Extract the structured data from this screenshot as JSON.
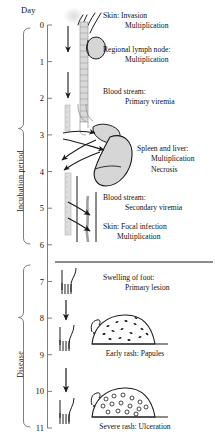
{
  "figure": {
    "axis_title": "Day",
    "tick_labels": [
      "0",
      "1",
      "2",
      "3",
      "4",
      "5",
      "6",
      "7",
      "8",
      "9",
      "10",
      "11"
    ],
    "phase_brackets": [
      {
        "label": "Incubation period",
        "from_day": 0,
        "to_day": 7
      },
      {
        "label": "Disease",
        "from_day": 7,
        "to_day": 11
      }
    ],
    "events": [
      {
        "id": "skin-invasion",
        "day": 0.1,
        "line1": "Skin: Invasion",
        "line2": "Multiplication"
      },
      {
        "id": "regional-lymph-node",
        "day": 1.0,
        "line1": "Regional lymph node:",
        "line2": "Multiplication"
      },
      {
        "id": "blood-primary",
        "day": 2.3,
        "line1": "Blood stream:",
        "line2": "Primary viremia"
      },
      {
        "id": "spleen-liver",
        "day": 3.8,
        "line1": "Spleen and liver:",
        "line2": "Multiplication",
        "line3": "Necrosis"
      },
      {
        "id": "blood-secondary",
        "day": 5.1,
        "line1": "Blood stream:",
        "line2": "Secondary viremia"
      },
      {
        "id": "skin-focal",
        "day": 6.0,
        "line1": "Skin: Focal infection",
        "line2": "Multiplication"
      },
      {
        "id": "swelling-of-foot",
        "day": 7.5,
        "line1": "Swelling of foot:",
        "line2": "Primary lesion"
      }
    ],
    "captions": [
      {
        "id": "early-rash",
        "line1": "Early rash:",
        "line2": "Papules"
      },
      {
        "id": "severe-rash",
        "line1": "Severe rash:",
        "line2": "Ulceration"
      }
    ],
    "colors": {
      "ink": "#1a1a1a",
      "axis": "#6f6f6f",
      "organ_fill": "#d6d6d6",
      "vessel_fill": "#cfcfcf",
      "skin_glow": "#e9e9e9"
    },
    "divider_day": 7
  }
}
